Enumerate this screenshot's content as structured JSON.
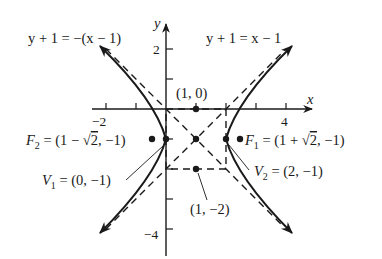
{
  "figure": {
    "type": "hyperbola-graph",
    "axes": {
      "x_label": "x",
      "y_label": "y",
      "x_tick_labels": [
        {
          "value": -2,
          "text": "−2"
        },
        {
          "value": 4,
          "text": "4"
        }
      ],
      "y_tick_labels": [
        {
          "value": 2,
          "text": "2"
        },
        {
          "value": -4,
          "text": "−4"
        }
      ]
    },
    "asymptotes": [
      {
        "id": "asymptote-negative",
        "equation": "y + 1 = −(x − 1)"
      },
      {
        "id": "asymptote-positive",
        "equation": "y + 1 = x − 1"
      }
    ],
    "points": {
      "top": {
        "label": "(1, 0)"
      },
      "bottom": {
        "label": "(1, −2)"
      },
      "focus2": {
        "name": "F",
        "sub": "2",
        "rest": " = (1 − ",
        "sqrt": "2",
        "tail": ", −1)"
      },
      "focus1": {
        "name": "F",
        "sub": "1",
        "rest": " = (1 + ",
        "sqrt": "2",
        "tail": ", −1)"
      },
      "vertex1": {
        "name": "V",
        "sub": "1",
        "rest": " = (0, −1)"
      },
      "vertex2": {
        "name": "V",
        "sub": "2",
        "rest": " = (2, −1)"
      }
    },
    "colors": {
      "ink": "#1a1a1a",
      "background": "#ffffff"
    }
  }
}
